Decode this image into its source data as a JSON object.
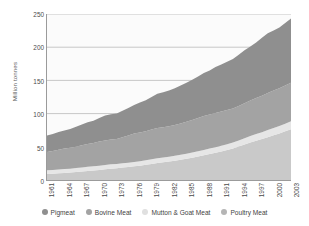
{
  "chart_data": {
    "type": "area",
    "stacked": true,
    "title": "",
    "subtitle": "",
    "xlabel": "",
    "ylabel": "Million tonnes",
    "ylim": [
      0,
      250
    ],
    "yticks": [
      0,
      50,
      100,
      150,
      200,
      250
    ],
    "ytick_labels": [
      "0",
      "50",
      "100",
      "150",
      "200",
      "250"
    ],
    "grid": true,
    "grid_axis": "y",
    "legend_position": "bottom",
    "x": [
      1961,
      1962,
      1963,
      1964,
      1965,
      1966,
      1967,
      1968,
      1969,
      1970,
      1971,
      1972,
      1973,
      1974,
      1975,
      1976,
      1977,
      1978,
      1979,
      1980,
      1981,
      1982,
      1983,
      1984,
      1985,
      1986,
      1987,
      1988,
      1989,
      1990,
      1991,
      1992,
      1993,
      1994,
      1995,
      1996,
      1997,
      1998,
      1999,
      2000,
      2001,
      2002,
      2003
    ],
    "xtick_labels": [
      "1961",
      "1964",
      "1967",
      "1970",
      "1973",
      "1976",
      "1979",
      "1982",
      "1985",
      "1988",
      "1991",
      "1994",
      "1997",
      "2000",
      "2003"
    ],
    "xticks": [
      1961,
      1964,
      1967,
      1970,
      1973,
      1976,
      1979,
      1982,
      1985,
      1988,
      1991,
      1994,
      1997,
      2000,
      2003
    ],
    "series": [
      {
        "name": "Poultry Meat",
        "color": "#c9c9c9",
        "values": [
          9,
          9.5,
          10,
          10.6,
          11.2,
          12,
          12.8,
          13.6,
          14.4,
          15.2,
          16.2,
          17.1,
          17.8,
          18.7,
          19.4,
          20.6,
          21.6,
          22.8,
          24.2,
          25.6,
          26.6,
          27.8,
          29.1,
          30.6,
          31.9,
          33.6,
          35.4,
          37.2,
          39.1,
          41,
          42.9,
          45.2,
          47.6,
          50.4,
          53.3,
          56.3,
          59,
          61.6,
          64.5,
          67.4,
          70.2,
          73.4,
          76.5
        ]
      },
      {
        "name": "Mutton & Goat Meat",
        "color": "#e6e6e6",
        "values": [
          5.6,
          5.7,
          5.8,
          5.8,
          5.9,
          6,
          6.1,
          6.2,
          6.3,
          6.4,
          6.5,
          6.5,
          6.4,
          6.5,
          6.6,
          6.6,
          6.7,
          6.8,
          6.9,
          7,
          7.1,
          7.2,
          7.3,
          7.4,
          7.6,
          7.8,
          7.9,
          8.1,
          8.2,
          8.4,
          8.5,
          8.7,
          8.9,
          9.2,
          9.5,
          9.8,
          10.1,
          10.4,
          10.7,
          11,
          11.2,
          11.5,
          11.8
        ]
      },
      {
        "name": "Bovine Meat",
        "color": "#a3a3a3",
        "values": [
          27.7,
          28.4,
          29.6,
          31,
          31.4,
          32.2,
          33.3,
          34.5,
          35.1,
          36.3,
          36.9,
          37.5,
          37.6,
          39,
          41.1,
          42.8,
          43.4,
          43.7,
          44.8,
          45.6,
          45.7,
          45.8,
          46.3,
          47.2,
          48.1,
          49,
          49.9,
          51.2,
          51.2,
          51.4,
          51.9,
          51.6,
          51.2,
          51.7,
          52.6,
          53.6,
          54.4,
          55,
          55.9,
          56.5,
          56.8,
          57.4,
          58.3
        ]
      },
      {
        "name": "Pigmeat",
        "color": "#8f8f8f",
        "values": [
          24.7,
          25.5,
          26.8,
          27.3,
          28.3,
          29.9,
          31.3,
          32.7,
          33.5,
          35.6,
          37.4,
          38.1,
          38.4,
          40.1,
          41.2,
          42.9,
          45.1,
          46.8,
          49.2,
          51.6,
          52.6,
          53.9,
          55.3,
          57,
          58.9,
          60.6,
          62.8,
          64.5,
          66.4,
          69.2,
          70.5,
          72.7,
          74.5,
          77.4,
          80.1,
          81.4,
          83.7,
          87.3,
          89.8,
          90.1,
          91.3,
          94.1,
          96.8
        ]
      }
    ],
    "totals_note": "2003 total ≈ 243"
  },
  "legend": {
    "items": [
      {
        "label": "Pigmeat",
        "color": "#8f8f8f"
      },
      {
        "label": "Bovine Meat",
        "color": "#a3a3a3"
      },
      {
        "label": "Mutton & Goat Meat",
        "color": "#e0e0e0"
      },
      {
        "label": "Poultry Meat",
        "color": "#b5b5b5"
      }
    ]
  },
  "axis": {
    "y_title": "Million tonnes"
  }
}
